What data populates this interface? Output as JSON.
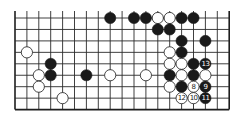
{
  "diagram": {
    "type": "go-board-fragment",
    "board_size": 19,
    "visible_columns": 19,
    "visible_rows": 9,
    "open_edge": "top",
    "colors": {
      "black": "#1a1a1a",
      "white": "#ffffff",
      "lines": "#2a2a2a",
      "background": "#ffffff"
    },
    "stones": [
      {
        "row": 0,
        "col": 8,
        "color": "black"
      },
      {
        "row": 0,
        "col": 10,
        "color": "black"
      },
      {
        "row": 0,
        "col": 11,
        "color": "black"
      },
      {
        "row": 0,
        "col": 12,
        "color": "white"
      },
      {
        "row": 0,
        "col": 13,
        "color": "white"
      },
      {
        "row": 0,
        "col": 14,
        "color": "black"
      },
      {
        "row": 0,
        "col": 15,
        "color": "black"
      },
      {
        "row": 1,
        "col": 12,
        "color": "black"
      },
      {
        "row": 1,
        "col": 13,
        "color": "black"
      },
      {
        "row": 2,
        "col": 14,
        "color": "black"
      },
      {
        "row": 2,
        "col": 16,
        "color": "black"
      },
      {
        "row": 3,
        "col": 1,
        "color": "white"
      },
      {
        "row": 3,
        "col": 13,
        "color": "white"
      },
      {
        "row": 3,
        "col": 14,
        "color": "black"
      },
      {
        "row": 4,
        "col": 3,
        "color": "black"
      },
      {
        "row": 4,
        "col": 13,
        "color": "white"
      },
      {
        "row": 4,
        "col": 14,
        "color": "white"
      },
      {
        "row": 4,
        "col": 15,
        "color": "black"
      },
      {
        "row": 4,
        "col": 16,
        "color": "black",
        "label": "13"
      },
      {
        "row": 5,
        "col": 2,
        "color": "white"
      },
      {
        "row": 5,
        "col": 3,
        "color": "black"
      },
      {
        "row": 5,
        "col": 6,
        "color": "black"
      },
      {
        "row": 5,
        "col": 8,
        "color": "white"
      },
      {
        "row": 5,
        "col": 11,
        "color": "white"
      },
      {
        "row": 5,
        "col": 13,
        "color": "black"
      },
      {
        "row": 5,
        "col": 14,
        "color": "white"
      },
      {
        "row": 5,
        "col": 15,
        "color": "black"
      },
      {
        "row": 5,
        "col": 16,
        "color": "white"
      },
      {
        "row": 6,
        "col": 2,
        "color": "white"
      },
      {
        "row": 6,
        "col": 13,
        "color": "white"
      },
      {
        "row": 6,
        "col": 14,
        "color": "black"
      },
      {
        "row": 6,
        "col": 15,
        "color": "white",
        "label": "8"
      },
      {
        "row": 6,
        "col": 16,
        "color": "black",
        "label": "9"
      },
      {
        "row": 7,
        "col": 4,
        "color": "white"
      },
      {
        "row": 7,
        "col": 14,
        "color": "white",
        "label": "12"
      },
      {
        "row": 7,
        "col": 15,
        "color": "white",
        "label": "10"
      },
      {
        "row": 7,
        "col": 16,
        "color": "black",
        "label": "11"
      }
    ]
  }
}
